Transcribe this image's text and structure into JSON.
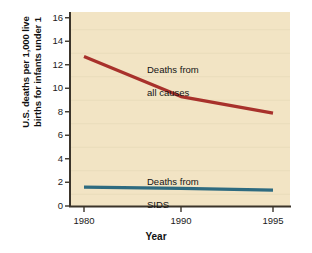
{
  "chart_data": {
    "type": "line",
    "title": "",
    "subtitle": "",
    "xlabel": "Year",
    "ylabel": "U.S. deaths per 1,000 live births for infants under 1",
    "ylabel_line1": "U.S. deaths per 1,000 live",
    "ylabel_line2": "births for infants under 1",
    "categories": [
      "1980",
      "1990",
      "1995"
    ],
    "x": [
      1980,
      1990,
      1995
    ],
    "xtick_labels": [
      "1980",
      "1990",
      "1995"
    ],
    "ytick_labels": [
      "0",
      "2",
      "4",
      "6",
      "8",
      "10",
      "12",
      "14",
      "16"
    ],
    "yticks": [
      0,
      2,
      4,
      6,
      8,
      10,
      12,
      14,
      16
    ],
    "ylim": [
      0,
      16
    ],
    "grid": "horizontal-faint",
    "legend_position": "inline-annotations",
    "series": [
      {
        "name": "Deaths from all causes",
        "label_line1": "Deaths from",
        "label_line2": "all causes",
        "color": "#a8312b",
        "values": [
          12.7,
          9.3,
          7.9
        ]
      },
      {
        "name": "Deaths from SIDS",
        "label_line1": "Deaths from",
        "label_line2": "SIDS",
        "color": "#2e6b80",
        "values": [
          1.6,
          1.5,
          1.35
        ]
      }
    ],
    "plot_background_color": "#f2e4c4",
    "axis_color": "#3b342a",
    "page_background_color": "#ffffff"
  }
}
